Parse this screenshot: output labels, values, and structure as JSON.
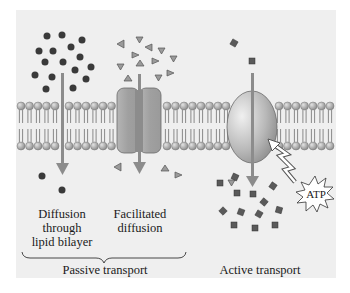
{
  "figure": {
    "background_color": "#efefef",
    "membrane": {
      "head_color": "#a8a8a8",
      "tail_color": "#6e6e6e"
    },
    "panels": [
      {
        "id": "simple-diffusion",
        "label_lines": [
          "Diffusion",
          "through",
          "lipid bilayer"
        ],
        "molecule_shape": "circle",
        "molecule_color": "#3a3a3a"
      },
      {
        "id": "facilitated-diffusion",
        "label_lines": [
          "Facilitated",
          "diffusion"
        ],
        "molecule_shape": "triangle",
        "molecule_color": "#8a8a8a",
        "protein": "channel-protein"
      },
      {
        "id": "active-transport",
        "label": "Active transport",
        "molecule_shape": "square",
        "molecule_color": "#5a5a5a",
        "protein": "carrier-pump",
        "energy_label": "ATP"
      }
    ],
    "group_bracket_label": "Passive transport",
    "arrow_color": "#8c8c8c"
  }
}
